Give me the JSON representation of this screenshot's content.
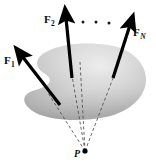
{
  "figure": {
    "background_color": "#ffffff",
    "body_shape": {
      "name": "rigid-body-blob",
      "fill_light": "#e6e6e6",
      "fill_mid": "#c2c2c2",
      "fill_dark": "#9e9e9e",
      "outline": "none"
    },
    "vectors": [
      {
        "id": "F1",
        "label_main": "F",
        "label_sub": "1",
        "label_sub_italic": false,
        "color": "#000000",
        "tail_x": 60,
        "tail_y": 105,
        "tip_x": 19,
        "tip_y": 52
      },
      {
        "id": "F2",
        "label_main": "F",
        "label_sub": "2",
        "label_sub_italic": false,
        "color": "#000000",
        "tail_x": 72,
        "tail_y": 78,
        "tip_x": 65,
        "tip_y": 14
      },
      {
        "id": "FN",
        "label_main": "F",
        "label_sub": "N",
        "label_sub_italic": true,
        "color": "#000000",
        "tail_x": 113,
        "tail_y": 78,
        "tip_x": 132,
        "tip_y": 21
      }
    ],
    "ellipsis_dots": {
      "name": "ellipsis-dots",
      "count": 3,
      "color": "#1a1a1a",
      "points": [
        {
          "x": 83,
          "y": 22
        },
        {
          "x": 96,
          "y": 22
        },
        {
          "x": 109,
          "y": 23
        }
      ]
    },
    "concurrency_point": {
      "name": "point-P",
      "label": "P",
      "x": 85,
      "y": 151,
      "dot_radius": 2.6,
      "dot_color": "#000000"
    },
    "lines_of_action": {
      "name": "dashed-lines-of-action",
      "style": "dashed",
      "color": "#4d4d4d",
      "dash": "3 2.4",
      "width": 0.85,
      "lines": [
        {
          "from_x": 85,
          "from_y": 151,
          "to_x": 48,
          "to_y": 93
        },
        {
          "from_x": 85,
          "from_y": 151,
          "to_x": 70,
          "to_y": 64
        },
        {
          "from_x": 85,
          "from_y": 151,
          "to_x": 80,
          "to_y": 63
        },
        {
          "from_x": 85,
          "from_y": 151,
          "to_x": 117,
          "to_y": 68
        }
      ]
    }
  }
}
